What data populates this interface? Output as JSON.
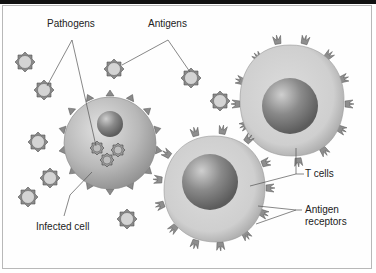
{
  "diagram": {
    "labels": {
      "pathogens": "Pathogens",
      "antigens": "Antigens",
      "t_cells": "T cells",
      "antigen_receptors_line1": "Antigen",
      "antigen_receptors_line2": "receptors",
      "infected_cell": "Infected cell"
    },
    "colors": {
      "cell_fill": "#b5b5b5",
      "nucleus_fill": "#7a7a7a",
      "pathogen_fill": "#d4d4d4",
      "spike_fill": "#8a8a8a",
      "leader_line": "#555555",
      "frame": "#b8b8b8"
    }
  }
}
